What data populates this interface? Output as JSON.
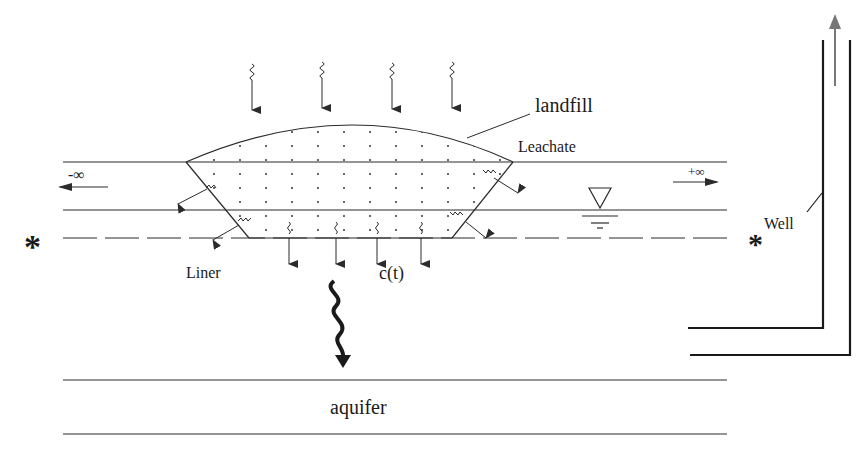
{
  "diagram": {
    "type": "landfill-leachate-transport-schematic",
    "labels": {
      "landfill": "landfill",
      "leachate": "Leachate",
      "liner": "Liner",
      "concentration": "c(t)",
      "aquifer": "aquifer",
      "well": "Well",
      "minus_infinity": "-∞",
      "plus_infinity": "+∞",
      "observation_marker_left": "*",
      "observation_marker_right": "*"
    },
    "elements": {
      "rain_arrows_count": 4,
      "liner_leak_arrows_count": 4,
      "side_leak_arrows_count": 4,
      "water_table_symbol": "inverted-triangle",
      "main_infiltration_arrow": "bold-wavy-down-arrow",
      "well_flow_arrow": "up-arrow"
    },
    "colors": {
      "line": "#2b2b2b",
      "background": "#ffffff",
      "well_arrow": "#777777"
    }
  }
}
